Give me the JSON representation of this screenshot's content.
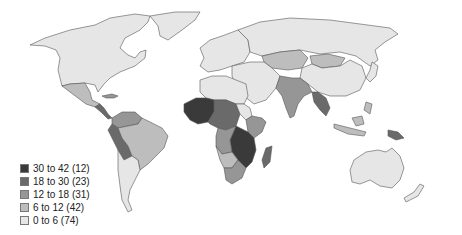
{
  "map": {
    "type": "choropleth",
    "region": "world",
    "stroke_color": "#555555",
    "classes": [
      {
        "key": "c5",
        "range": "30 to 42",
        "count": 12,
        "label": "30 to 42 (12)",
        "color": "#3a3a3a"
      },
      {
        "key": "c4",
        "range": "18 to 30",
        "count": 23,
        "label": "18 to 30 (23)",
        "color": "#6a6a6a"
      },
      {
        "key": "c3",
        "range": "12 to 18",
        "count": 31,
        "label": "12 to 18 (31)",
        "color": "#969696"
      },
      {
        "key": "c2",
        "range": "6 to 12",
        "count": 42,
        "label": "6 to 12 (42)",
        "color": "#bdbdbd"
      },
      {
        "key": "c1",
        "range": "0 to 6",
        "count": 74,
        "label": "0 to 6 (74)",
        "color": "#e6e6e6"
      }
    ]
  },
  "legend": {
    "items": [
      {
        "label": "30 to 42 (12)",
        "color": "#3a3a3a"
      },
      {
        "label": "18 to 30 (23)",
        "color": "#6a6a6a"
      },
      {
        "label": "12 to 18 (31)",
        "color": "#969696"
      },
      {
        "label": "6 to 12 (42)",
        "color": "#bdbdbd"
      },
      {
        "label": "0 to 6 (74)",
        "color": "#e6e6e6"
      }
    ]
  }
}
